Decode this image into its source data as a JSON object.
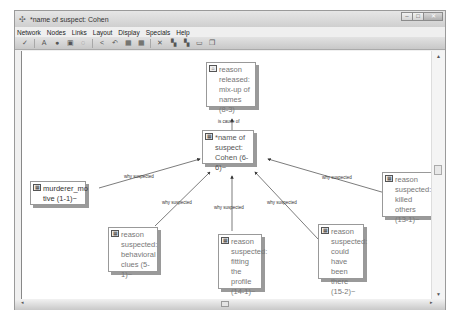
{
  "window": {
    "title": "*name of suspect: Cohen",
    "controls": [
      "minimize",
      "maximize",
      "close"
    ]
  },
  "menubar": {
    "items": [
      "Network",
      "Nodes",
      "Links",
      "Layout",
      "Display",
      "Specials",
      "Help"
    ]
  },
  "toolbar": {
    "buttons": [
      {
        "icon": "check-icon",
        "glyph": "✓"
      },
      {
        "icon": "text-icon",
        "glyph": "A"
      },
      {
        "icon": "node-circle-icon",
        "glyph": "●"
      },
      {
        "icon": "image-icon",
        "glyph": "▣"
      },
      {
        "icon": "comment-icon",
        "glyph": "◌"
      },
      {
        "icon": "share-icon",
        "glyph": "<"
      },
      {
        "icon": "undo-icon",
        "glyph": "↶"
      },
      {
        "icon": "grid-icon",
        "glyph": "▦"
      },
      {
        "icon": "expand-grid-icon",
        "glyph": "▦"
      },
      {
        "icon": "delete-icon",
        "glyph": "✕"
      },
      {
        "icon": "filter-icon",
        "glyph": "▚"
      },
      {
        "icon": "filter2-icon",
        "glyph": "▚"
      },
      {
        "icon": "window-icon",
        "glyph": "▭"
      },
      {
        "icon": "copy-icon",
        "glyph": "❐"
      }
    ]
  },
  "nodes": [
    {
      "id": "released",
      "text": "reason released: mix-up of names (8-3)",
      "lines": [
        "reason",
        "released:",
        "mix-up of",
        "names (8-3)"
      ]
    },
    {
      "id": "central",
      "text": "*name of suspect: Cohen (6-6)~",
      "lines": [
        "*name of",
        "suspect:",
        "Cohen (6-6)~"
      ]
    },
    {
      "id": "motive",
      "text": "murderer_motive (1-1)~",
      "lines": [
        "murderer_mo",
        "tive (1-1)~"
      ]
    },
    {
      "id": "behavioral",
      "text": "reason suspected: behavioral clues (5-1)~",
      "lines": [
        "reason",
        "suspected:",
        "behavioral",
        "clues (5-1)~"
      ]
    },
    {
      "id": "profile",
      "text": "reason suspected: fitting the profile (14-1)~",
      "lines": [
        "reason",
        "suspected:",
        "fitting the",
        "profile",
        "(14-1)~"
      ]
    },
    {
      "id": "couldhave",
      "text": "reason suspected: could have been there (15-2)~",
      "lines": [
        "reason",
        "suspected:",
        "could have",
        "been there",
        "(15-2)~"
      ]
    },
    {
      "id": "killed",
      "text": "reason suspected: killed others (13-1)~",
      "lines": [
        "reason",
        "suspected:",
        "killed others",
        "(13-1)~"
      ]
    }
  ],
  "links": [
    {
      "label": "is cause of",
      "from": "central",
      "to": "released"
    },
    {
      "label": "why suspected",
      "from": "motive",
      "to": "central"
    },
    {
      "label": "why suspected",
      "from": "behavioral",
      "to": "central"
    },
    {
      "label": "why suspected",
      "from": "profile",
      "to": "central"
    },
    {
      "label": "why suspected",
      "from": "couldhave",
      "to": "central"
    },
    {
      "label": "why suspected",
      "from": "killed",
      "to": "central"
    }
  ]
}
